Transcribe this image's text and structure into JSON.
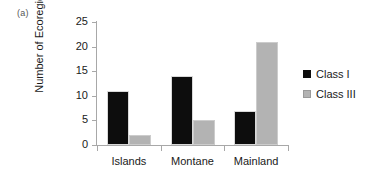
{
  "figure": {
    "panel_label": "(a)",
    "background_color": "#ffffff"
  },
  "chart_data": {
    "type": "bar",
    "title": "",
    "subtitle": "",
    "xlabel": "",
    "ylabel": "Number of Ecoregions",
    "categories": [
      "Islands",
      "Montane",
      "Mainland"
    ],
    "series": [
      {
        "name": "Class I",
        "values": [
          11,
          14,
          7
        ],
        "color": "#0d0d0d"
      },
      {
        "name": "Class III",
        "values": [
          2,
          5,
          21
        ],
        "color": "#b3b3b3"
      }
    ],
    "ylim": [
      0,
      25
    ],
    "ytick_labels": [
      "0",
      "5",
      "10",
      "15",
      "20",
      "25"
    ],
    "ytick_values": [
      0,
      5,
      10,
      15,
      20,
      25
    ],
    "grid": false,
    "legend_position": "right",
    "annotations": [
      "(a)"
    ]
  },
  "legend": {
    "entries": [
      {
        "label": "Class I",
        "swatch": "black-square-icon"
      },
      {
        "label": "Class III",
        "swatch": "gray-square-icon"
      }
    ]
  }
}
